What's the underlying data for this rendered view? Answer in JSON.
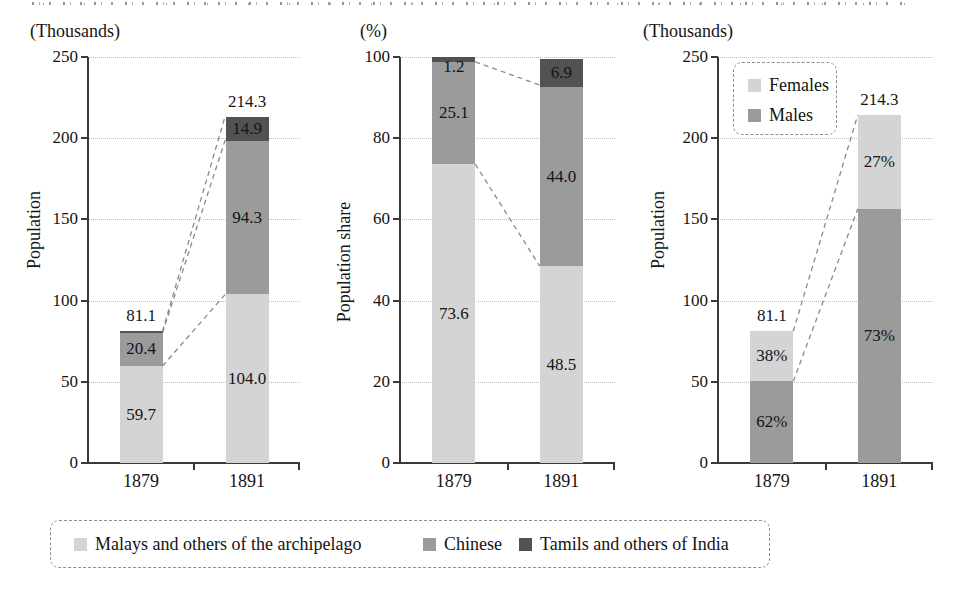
{
  "figure": {
    "description_texts": {
      "left_unit": "(Thousands)",
      "middle_unit": "(%)",
      "right_unit": "(Thousands)",
      "left_ylabel": "Population",
      "middle_ylabel": "Population share",
      "right_ylabel": "Population"
    }
  },
  "colors": {
    "malays": "#d4d4d4",
    "chinese": "#9b9b9b",
    "tamils": "#525252",
    "females": "#d4d4d4",
    "males": "#9b9b9b",
    "axis": "#3a3a3a",
    "grid": "#bfbfbf",
    "connector": "#8a8a8a",
    "text": "#141414"
  },
  "chart_data": [
    {
      "type": "bar",
      "stacked": true,
      "unit_header": "(Thousands)",
      "ylabel": "Population",
      "ylim": [
        0,
        250
      ],
      "ytick_step": 50,
      "grid": true,
      "categories": [
        "1879",
        "1891"
      ],
      "series": [
        {
          "name": "Malays and others of the archipelago",
          "color_key": "malays",
          "values": [
            59.7,
            104.0
          ],
          "labels": [
            "59.7",
            "104.0"
          ]
        },
        {
          "name": "Chinese",
          "color_key": "chinese",
          "values": [
            20.4,
            94.3
          ],
          "labels": [
            "20.4",
            "94.3"
          ]
        },
        {
          "name": "Tamils and others of India",
          "color_key": "tamils",
          "values": [
            1.0,
            14.9
          ],
          "labels": [
            "",
            "14.9"
          ]
        }
      ],
      "totals": [
        81.1,
        214.3
      ],
      "total_labels": [
        "81.1",
        "214.3"
      ],
      "connectors": [
        [
          0,
          81.1,
          1,
          214.3
        ],
        [
          0,
          80.1,
          1,
          199.4
        ],
        [
          0,
          59.7,
          1,
          104.0
        ]
      ]
    },
    {
      "type": "bar",
      "stacked": true,
      "unit_header": "(%)",
      "ylabel": "Population share",
      "ylim": [
        0,
        100
      ],
      "ytick_step": 20,
      "grid": true,
      "categories": [
        "1879",
        "1891"
      ],
      "series": [
        {
          "name": "Malays and others of the archipelago",
          "color_key": "malays",
          "values": [
            73.6,
            48.5
          ],
          "labels": [
            "73.6",
            "48.5"
          ]
        },
        {
          "name": "Chinese",
          "color_key": "chinese",
          "values": [
            25.1,
            44.0
          ],
          "labels": [
            "25.1",
            "44.0"
          ]
        },
        {
          "name": "Tamils and others of India",
          "color_key": "tamils",
          "values": [
            1.2,
            6.9
          ],
          "labels": [
            "1.2",
            "6.9"
          ]
        }
      ],
      "totals": [
        100,
        100
      ],
      "total_labels": [
        "",
        ""
      ],
      "connectors": [
        [
          0,
          98.8,
          1,
          93.1
        ],
        [
          0,
          73.6,
          1,
          48.5
        ]
      ]
    },
    {
      "type": "bar",
      "stacked": true,
      "unit_header": "(Thousands)",
      "ylabel": "Population",
      "ylim": [
        0,
        250
      ],
      "ytick_step": 50,
      "grid": true,
      "categories": [
        "1879",
        "1891"
      ],
      "series": [
        {
          "name": "Males",
          "color_key": "males",
          "values": [
            50.3,
            156.4
          ],
          "labels": [
            "62%",
            "73%"
          ]
        },
        {
          "name": "Females",
          "color_key": "females",
          "values": [
            30.8,
            57.9
          ],
          "labels": [
            "38%",
            "27%"
          ]
        }
      ],
      "totals": [
        81.1,
        214.3
      ],
      "total_labels": [
        "81.1",
        "214.3"
      ],
      "connectors": [
        [
          0,
          81.1,
          1,
          214.3
        ],
        [
          0,
          50.3,
          1,
          156.4
        ]
      ],
      "legend": {
        "items": [
          {
            "label": "Females",
            "color_key": "females"
          },
          {
            "label": "Males",
            "color_key": "males"
          }
        ]
      }
    }
  ],
  "legend_bottom": {
    "items": [
      {
        "label": "Malays and others of the archipelago",
        "color_key": "malays"
      },
      {
        "label": "Chinese",
        "color_key": "chinese"
      },
      {
        "label": "Tamils and others of India",
        "color_key": "tamils"
      }
    ]
  }
}
